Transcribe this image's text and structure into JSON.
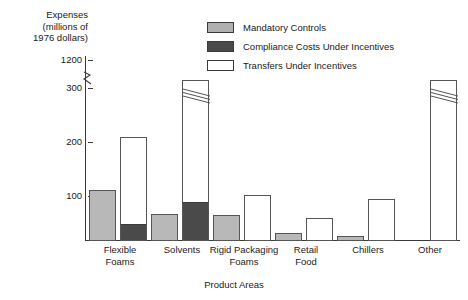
{
  "chart_data": {
    "type": "bar",
    "title": "",
    "ylabel": "Expenses\n(millions of\n1976 dollars)",
    "xlabel": "Product Areas",
    "categories": [
      "Flexible\nFoams",
      "Solvents",
      "Rigid Packaging\nFoams",
      "Retail\nFood",
      "Chillers",
      "Other"
    ],
    "ytick_labels": [
      "1200",
      "300",
      "200",
      "100"
    ],
    "ytick_values": [
      1200,
      300,
      200,
      100
    ],
    "ylim": [
      0,
      300
    ],
    "axis_break": true,
    "axis_break_note": "y-axis broken between 300 and 1200",
    "grid": false,
    "legend_position": "top-center",
    "series": [
      {
        "name": "Mandatory Controls",
        "color": "#b8b8b8",
        "values": [
          95,
          50,
          48,
          15,
          10,
          0
        ]
      },
      {
        "name": "Compliance Costs Under Incentives",
        "color": "#4a4a4a",
        "values": [
          30,
          70,
          0,
          0,
          0,
          0
        ]
      },
      {
        "name": "Transfers Under Incentives",
        "color": "#ffffff",
        "values": [
          193,
          305,
          85,
          42,
          78,
          1200
        ]
      }
    ],
    "notes": [
      "Transfers Under Incentives bars are drawn stacked above the Compliance Costs segment.",
      "The Other bar is truncated with a break mark near 1200."
    ]
  },
  "legend": {
    "items": [
      {
        "label": "Mandatory Controls",
        "swatch": "mandatory-swatch"
      },
      {
        "label": "Compliance Costs Under Incentives",
        "swatch": "compliance-swatch"
      },
      {
        "label": "Transfers Under Incentives",
        "swatch": "transfers-swatch"
      }
    ]
  },
  "axes": {
    "y_title": "Expenses\n(millions of\n1976 dollars)",
    "x_title": "Product Areas",
    "ticks": [
      {
        "label": "1200"
      },
      {
        "label": "300"
      },
      {
        "label": "200"
      },
      {
        "label": "100"
      }
    ]
  }
}
